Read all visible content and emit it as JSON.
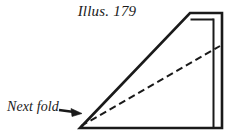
{
  "figure": {
    "title": "Illus. 179",
    "caption_label": "Next fold",
    "background_color": "#ffffff",
    "ink_color": "#1a1a1a"
  },
  "diagram": {
    "shape_name": "right-trapezoid-paper",
    "solid_outline_points": "80,128 190,13 222,13 222,128 80,128",
    "inner_flap_top_line": "190,19 213,19",
    "inner_flap_right_line": "213,19 213,126",
    "dashed_fold_line": {
      "from_x": 81,
      "from_y": 126,
      "to_x": 220,
      "to_y": 46,
      "dash_pattern": "7,4"
    },
    "arrow": {
      "name": "next-fold-arrow",
      "from_x": 60,
      "from_y": 110,
      "to_x": 80,
      "to_y": 113
    }
  }
}
